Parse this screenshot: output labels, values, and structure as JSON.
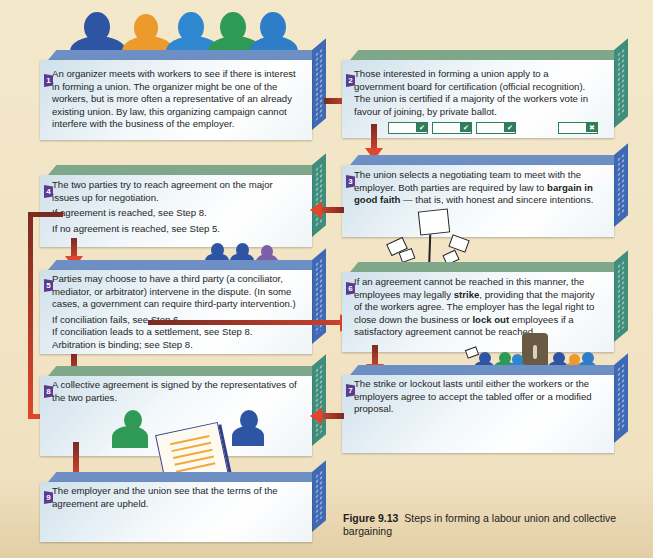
{
  "figure": {
    "caption_label": "Figure 9.13",
    "caption_text": "Steps in forming a labour union and collective bargaining"
  },
  "colors": {
    "background": "#f3e6c8",
    "box_green_top": "#7fa88a",
    "box_green_side": "#3f8e7c",
    "box_blue_top": "#6e8fc4",
    "box_blue_side": "#3f69b5",
    "step_badge": "#5b3a8f",
    "arrow": "#e0462d",
    "arrow_dark": "#7a2b22",
    "ballot_green": "#2f7d59"
  },
  "steps": [
    {
      "number": "1",
      "text": "An organizer meets with workers to see if there is interest in forming a union. The organizer might be one of the workers, but is more often a representative of an already existing union. By law, this organizing campaign cannot interfere with the business of the employer."
    },
    {
      "number": "2",
      "text": "Those interested in forming a union apply to a government board for certification (official recognition). The union is certified if a majority of the workers vote in favour of joining, by private ballot."
    },
    {
      "number": "3",
      "text_a": "The union selects a negotiating team to meet with the employer. Both parties are required by law to ",
      "bold_a": "bargain in good faith",
      "text_b": " — that is, with honest and sincere intentions."
    },
    {
      "number": "4",
      "text": "The two parties try to reach agreement on the major issues up for negotiation.",
      "if_yes": "If agreement is reached, see Step 8.",
      "if_no": "If no agreement is reached, see Step 5."
    },
    {
      "number": "5",
      "text": "Parties may choose to have a third party (a conciliator, mediator, or arbitrator) intervene in the dispute. (In some cases, a government can require third-party intervention.)",
      "if_fail": "If conciliation fails, see Step 6.",
      "if_settle": "If conciliation leads to a settlement, see Step 8. Arbitration is binding; see Step 8."
    },
    {
      "number": "6",
      "text_a": "If an agreement cannot be reached in this manner, the employees may legally ",
      "bold_a": "strike",
      "text_b": ", providing that the majority of the workers agree. The employer has the legal right to close down the business or ",
      "bold_b": "lock out",
      "text_c": " employees if a satisfactory agreement cannot be reached."
    },
    {
      "number": "7",
      "text": "The strike or lockout lasts until either the workers or the employers agree to accept the tabled offer or a modified proposal."
    },
    {
      "number": "8",
      "text": "A collective agreement is signed by the representatives of the two parties."
    },
    {
      "number": "9",
      "text": "The employer and the union see that the terms of the agreement are upheld."
    }
  ],
  "ballots": [
    {
      "mark": "✔"
    },
    {
      "mark": "✔"
    },
    {
      "mark": "✔"
    },
    {
      "mark": "✖"
    }
  ]
}
